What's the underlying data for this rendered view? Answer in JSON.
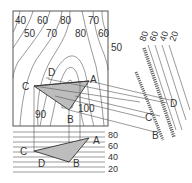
{
  "map_view": {
    "contour_labels": [
      {
        "text": "40",
        "x": 15,
        "y": 24
      },
      {
        "text": "60",
        "x": 37,
        "y": 24
      },
      {
        "text": "80",
        "x": 62,
        "y": 24
      },
      {
        "text": "70",
        "x": 91,
        "y": 24
      },
      {
        "text": "50",
        "x": 25,
        "y": 37
      },
      {
        "text": "70",
        "x": 48,
        "y": 37
      },
      {
        "text": "80",
        "x": 77,
        "y": 37
      },
      {
        "text": "60",
        "x": 102,
        "y": 37
      },
      {
        "text": "50",
        "x": 111,
        "y": 50
      },
      {
        "text": "90",
        "x": 36,
        "y": 118
      },
      {
        "text": "100",
        "x": 80,
        "y": 112
      }
    ],
    "points": [
      {
        "text": "A",
        "x": 90,
        "y": 81
      },
      {
        "text": "B",
        "x": 68,
        "y": 123
      },
      {
        "text": "C",
        "x": 24,
        "y": 88
      },
      {
        "text": "D",
        "x": 48,
        "y": 75
      }
    ]
  },
  "section_view": {
    "elevation_labels": [
      "80",
      "60",
      "40",
      "20"
    ],
    "points": [
      {
        "text": "A",
        "x": 92,
        "y": 144
      },
      {
        "text": "B",
        "x": 75,
        "y": 167
      },
      {
        "text": "C",
        "x": 22,
        "y": 155
      },
      {
        "text": "D",
        "x": 38,
        "y": 167
      }
    ]
  },
  "rotated_view": {
    "elevation_labels": [
      "80",
      "60",
      "40",
      "20"
    ],
    "points": [
      {
        "text": "D",
        "x": 170,
        "y": 107
      },
      {
        "text": "C",
        "x": 145,
        "y": 121
      },
      {
        "text": "B",
        "x": 152,
        "y": 139
      }
    ]
  }
}
